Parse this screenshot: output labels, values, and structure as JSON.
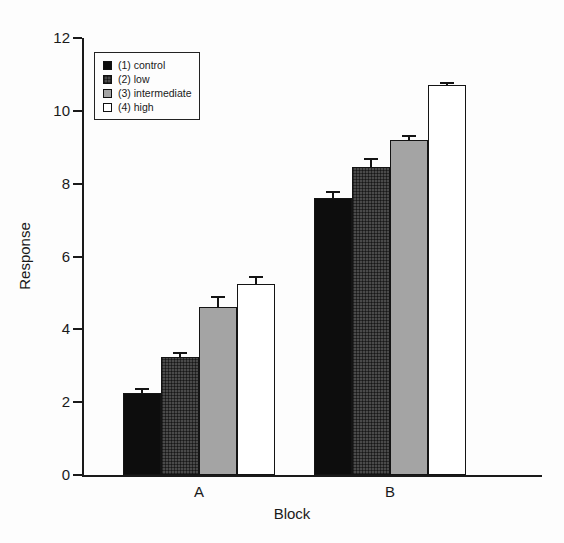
{
  "figure": {
    "background": "#fdfdfd",
    "ink": "#1a1a1a"
  },
  "chart_data": {
    "type": "bar",
    "title": "",
    "xlabel": "Block",
    "ylabel": "Response",
    "categories": [
      "A",
      "B"
    ],
    "series": [
      {
        "name": "(1) control",
        "fill": "#0d0d0d",
        "pattern": "solid",
        "values": [
          2.25,
          7.6
        ],
        "errors": [
          0.12,
          0.18
        ]
      },
      {
        "name": "(2) low",
        "fill": "#454545",
        "pattern": "crosshatch",
        "values": [
          3.25,
          8.45
        ],
        "errors": [
          0.1,
          0.22
        ]
      },
      {
        "name": "(3) intermediate",
        "fill": "#a4a4a4",
        "pattern": "solid",
        "values": [
          4.6,
          9.2
        ],
        "errors": [
          0.28,
          0.1
        ]
      },
      {
        "name": "(4) high",
        "fill": "#ffffff",
        "pattern": "open",
        "values": [
          5.25,
          10.7
        ],
        "errors": [
          0.18,
          0.06
        ]
      }
    ],
    "ylim": [
      0,
      12
    ],
    "yticks": [
      0,
      2,
      4,
      6,
      8,
      10,
      12
    ],
    "legend_position": "upper-left",
    "grid": false,
    "error_bars": "upper"
  }
}
